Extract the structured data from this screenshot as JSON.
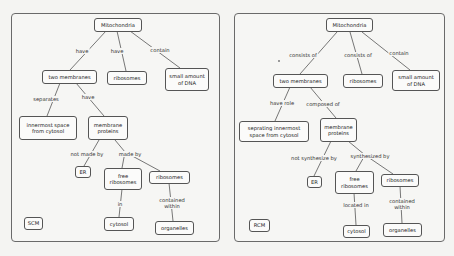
{
  "maps": [
    {
      "id": "scm",
      "tag": "SCM",
      "nodes": {
        "mitochondria": "Mitochondria",
        "two_membranes": "two membranes",
        "ribosomes_top": "ribosomes",
        "dna": "small amount\nof DNA",
        "innermost": "innermost space\nfrom cytosol",
        "membrane_proteins": "membrane\nproteins",
        "er": "ER",
        "free_ribosomes": "free\nribosomes",
        "ribosomes_bottom": "ribosomes",
        "cytosol": "cytosol",
        "organelles": "organelles"
      },
      "links": {
        "mito_membranes": "have",
        "mito_ribosomes": "have",
        "mito_dna": "contain",
        "membranes_innermost": "separates",
        "membranes_proteins": "have",
        "proteins_er": "not made by",
        "proteins_made": "made by",
        "free_cytosol": "in",
        "ribosomes_organelles": "contained\nwithin"
      }
    },
    {
      "id": "rcm",
      "tag": "RCM",
      "nodes": {
        "mitochondria": "Mitochondria",
        "two_membranes": "two membranes",
        "ribosomes_top": "ribosomes",
        "dna": "small amount\nof DNA",
        "innermost": "seprating innermost\nspace from cytosol",
        "membrane_proteins": "membrane\nproteins",
        "er": "ER",
        "free_ribosomes": "free\nribosomes",
        "ribosomes_bottom": "ribosomes",
        "cytosol": "cytosol",
        "organelles": "organelles"
      },
      "links": {
        "mito_membranes": "consists of",
        "mito_ribosomes": "consists of",
        "mito_dna": "contain",
        "membranes_innermost": "have role",
        "membranes_proteins": "composed of",
        "proteins_er": "not synthesize by",
        "proteins_made": "synthesized by",
        "free_cytosol": "located in",
        "ribosomes_organelles": "contained\nwithin"
      }
    }
  ]
}
